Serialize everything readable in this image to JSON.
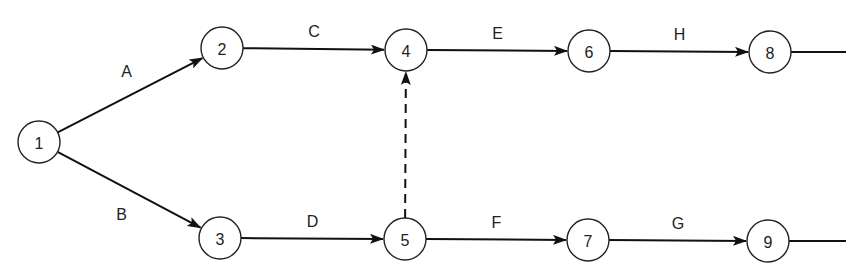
{
  "diagram": {
    "type": "activity-on-arrow network",
    "nodes": [
      {
        "id": "1",
        "label": "1",
        "x": 39,
        "y": 142
      },
      {
        "id": "2",
        "label": "2",
        "x": 222,
        "y": 48
      },
      {
        "id": "3",
        "label": "3",
        "x": 220,
        "y": 238
      },
      {
        "id": "4",
        "label": "4",
        "x": 406,
        "y": 50
      },
      {
        "id": "5",
        "label": "5",
        "x": 405,
        "y": 239
      },
      {
        "id": "6",
        "label": "6",
        "x": 589,
        "y": 51
      },
      {
        "id": "7",
        "label": "7",
        "x": 588,
        "y": 240
      },
      {
        "id": "8",
        "label": "8",
        "x": 770,
        "y": 52
      },
      {
        "id": "9",
        "label": "9",
        "x": 768,
        "y": 241
      }
    ],
    "edges": [
      {
        "from": "1",
        "to": "2",
        "label": "A",
        "style": "solid"
      },
      {
        "from": "1",
        "to": "3",
        "label": "B",
        "style": "solid"
      },
      {
        "from": "2",
        "to": "4",
        "label": "C",
        "style": "solid"
      },
      {
        "from": "3",
        "to": "5",
        "label": "D",
        "style": "solid"
      },
      {
        "from": "4",
        "to": "6",
        "label": "E",
        "style": "solid"
      },
      {
        "from": "5",
        "to": "7",
        "label": "F",
        "style": "solid"
      },
      {
        "from": "7",
        "to": "9",
        "label": "G",
        "style": "solid"
      },
      {
        "from": "6",
        "to": "8",
        "label": "H",
        "style": "solid"
      },
      {
        "from": "5",
        "to": "4",
        "label": "",
        "style": "dashed"
      }
    ],
    "trailing_lines": [
      {
        "from": "8"
      },
      {
        "from": "9"
      }
    ]
  }
}
